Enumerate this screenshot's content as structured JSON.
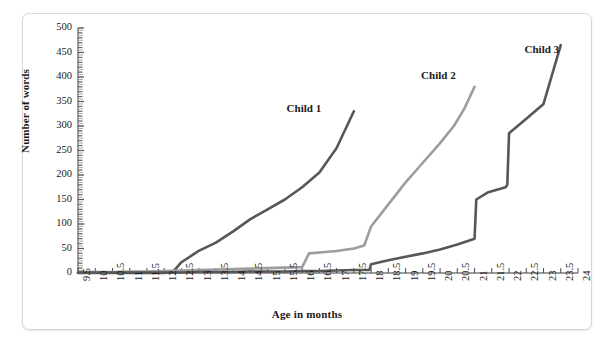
{
  "figure": {
    "background": "#ffffff",
    "border_color": "#d8d8d8"
  },
  "axes": {
    "xlabel": "Age in months",
    "ylabel": "Number of words"
  },
  "chart_data": {
    "type": "line",
    "title": "",
    "xlabel": "Age in months",
    "ylabel": "Number of words",
    "xlim": [
      9.5,
      24
    ],
    "ylim": [
      0,
      500
    ],
    "grid": false,
    "legend_position": "inline-labels",
    "x_ticks": [
      "9.5",
      "10",
      "10.5",
      "11",
      "11.5",
      "12",
      "12.5",
      "13",
      "13.5",
      "14",
      "14.5",
      "15",
      "15.5",
      "16",
      "16.5",
      "17",
      "17.5",
      "18",
      "18.5",
      "19",
      "19.5",
      "20",
      "20.5",
      "21",
      "21.5",
      "22",
      "22.5",
      "23",
      "23.5",
      "24"
    ],
    "x_tick_values": [
      9.5,
      10,
      10.5,
      11,
      11.5,
      12,
      12.5,
      13,
      13.5,
      14,
      14.5,
      15,
      15.5,
      16,
      16.5,
      17,
      17.5,
      18,
      18.5,
      19,
      19.5,
      20,
      20.5,
      21,
      21.5,
      22,
      22.5,
      23,
      23.5,
      24
    ],
    "y_ticks": [
      "0",
      "50",
      "100",
      "150",
      "200",
      "250",
      "300",
      "350",
      "400",
      "450",
      "500"
    ],
    "y_tick_values": [
      0,
      50,
      100,
      150,
      200,
      250,
      300,
      350,
      400,
      450,
      500
    ],
    "y_minor_step": 10,
    "series": [
      {
        "name": "Child 1",
        "color": "#575757",
        "width": 2.6,
        "label_x": 15.55,
        "label_y": 335,
        "x": [
          9.5,
          10,
          10.5,
          11,
          11.5,
          12,
          12.25,
          12.5,
          13,
          13.5,
          14,
          14.5,
          15,
          15.5,
          16,
          16.5,
          17,
          17.5
        ],
        "y": [
          0,
          0,
          0,
          0,
          0,
          0,
          2,
          22,
          45,
          62,
          85,
          110,
          130,
          150,
          175,
          205,
          255,
          330
        ]
      },
      {
        "name": "Child 2",
        "color": "#9d9d9d",
        "width": 2.6,
        "label_x": 19.45,
        "label_y": 402,
        "x": [
          9.5,
          10,
          10.5,
          11,
          11.5,
          12,
          12.5,
          13,
          13.5,
          14,
          14.5,
          15,
          15.5,
          16,
          16.2,
          16.5,
          17,
          17.5,
          17.8,
          18,
          18.5,
          19,
          19.5,
          20,
          20.4,
          20.7,
          21
        ],
        "y": [
          2,
          2,
          2,
          3,
          3,
          4,
          5,
          6,
          7,
          8,
          9,
          10,
          11,
          12,
          40,
          42,
          45,
          50,
          56,
          95,
          140,
          185,
          225,
          265,
          300,
          335,
          380
        ]
      },
      {
        "name": "Child 3",
        "color": "#575757",
        "width": 2.6,
        "label_x": 22.45,
        "label_y": 455,
        "x": [
          9.5,
          10,
          10.5,
          11,
          11.5,
          12,
          12.5,
          13,
          13.5,
          14,
          14.5,
          15,
          15.5,
          16,
          16.5,
          17,
          17.5,
          17.95,
          18,
          18.5,
          19,
          19.5,
          20,
          20.5,
          21,
          21.05,
          21.4,
          21.9,
          21.95,
          22,
          22.5,
          23,
          23.5
        ],
        "y": [
          1,
          1,
          1,
          1,
          1,
          1,
          1,
          2,
          2,
          2,
          3,
          3,
          3,
          4,
          4,
          5,
          6,
          6,
          18,
          26,
          33,
          40,
          48,
          58,
          70,
          150,
          165,
          175,
          180,
          285,
          315,
          345,
          465
        ]
      }
    ]
  }
}
